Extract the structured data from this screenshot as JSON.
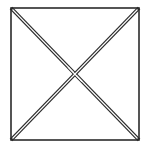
{
  "diagram": {
    "shape": "square-with-diagonals",
    "square": {
      "x1": 11,
      "y1": 8,
      "x2": 139,
      "y2": 140
    },
    "diagonals": [
      {
        "name": "top-left-to-bottom-right",
        "style": "double-line"
      },
      {
        "name": "top-right-to-bottom-left",
        "style": "double-line"
      }
    ],
    "colors": {
      "stroke": "#2b2b2b",
      "background": "#ffffff"
    }
  }
}
